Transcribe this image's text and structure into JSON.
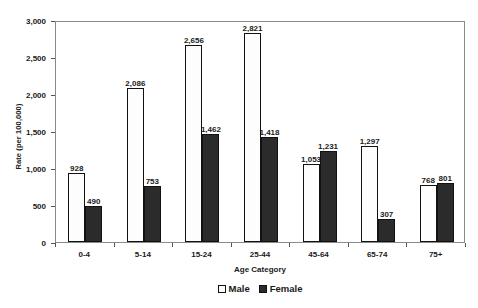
{
  "chart_data": {
    "type": "bar",
    "title": "",
    "xlabel": "Age Category",
    "ylabel": "Rate (per 100,000)",
    "ylim": [
      0,
      3000
    ],
    "ytick_step": 500,
    "ytick_labels": [
      "3,000",
      "2,500",
      "2,000",
      "1,500",
      "1,000",
      "500",
      "0"
    ],
    "ytick_values": [
      3000,
      2500,
      2000,
      1500,
      1000,
      500,
      0
    ],
    "grid": false,
    "legend_position": "bottom-center",
    "categories": [
      "0-4",
      "5-14",
      "15-24",
      "25-44",
      "45-64",
      "65-74",
      "75+"
    ],
    "series": [
      {
        "name": "Male",
        "color": "#fdfdfd",
        "pattern": "dotted",
        "values": [
          928,
          2086,
          2656,
          2821,
          1053,
          1297,
          768
        ],
        "labels": [
          "928",
          "2,086",
          "2,656",
          "2,821",
          "1,053",
          "1,297",
          "768"
        ]
      },
      {
        "name": "Female",
        "color": "#2b2b2b",
        "pattern": "solid",
        "values": [
          490,
          753,
          1462,
          1418,
          1231,
          307,
          801
        ],
        "labels": [
          "490",
          "753",
          "1,462",
          "1,418",
          "1,231",
          "307",
          "801"
        ]
      }
    ]
  },
  "legend": {
    "items": [
      {
        "label": "Male"
      },
      {
        "label": "Female"
      }
    ]
  }
}
